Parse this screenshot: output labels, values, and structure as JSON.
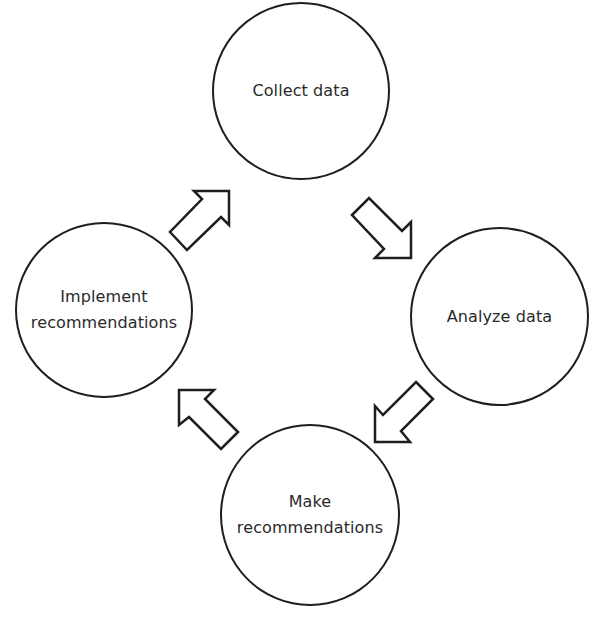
{
  "diagram": {
    "type": "cycle",
    "direction": "clockwise",
    "nodes": [
      {
        "id": "collect",
        "label": "Collect data"
      },
      {
        "id": "analyze",
        "label": "Analyze data"
      },
      {
        "id": "make",
        "label": "Make\nrecommendations"
      },
      {
        "id": "implement",
        "label": "Implement\nrecommendations"
      }
    ],
    "edges": [
      {
        "from": "collect",
        "to": "analyze",
        "arrow": "hollow-block"
      },
      {
        "from": "analyze",
        "to": "make",
        "arrow": "hollow-block"
      },
      {
        "from": "make",
        "to": "implement",
        "arrow": "hollow-block"
      },
      {
        "from": "implement",
        "to": "collect",
        "arrow": "hollow-block"
      }
    ]
  },
  "style": {
    "stroke_color": "#1e1e1e",
    "text_color": "#2a2a2a",
    "background": "#ffffff"
  }
}
